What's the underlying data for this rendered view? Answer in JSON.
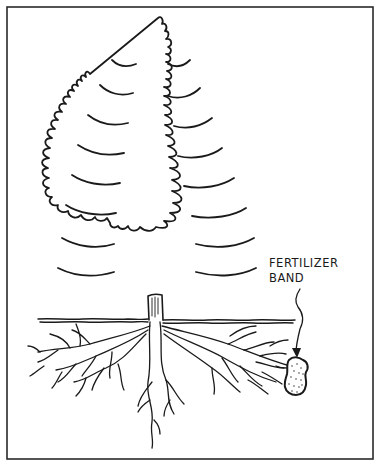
{
  "figure": {
    "label": {
      "line1": "FERTILIZER",
      "line2": "BAND"
    },
    "colors": {
      "ink": "#1a1a1a",
      "background": "#ffffff",
      "frame": "#2a2a2a"
    }
  }
}
